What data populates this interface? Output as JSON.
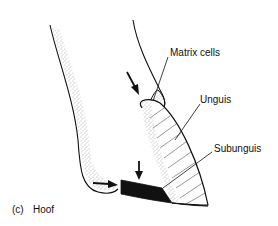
{
  "figure": {
    "panel_label": "(c)",
    "panel_title": "Hoof",
    "labels": {
      "matrix_cells": "Matrix cells",
      "unguis": "Unguis",
      "subunguis": "Subunguis"
    },
    "colors": {
      "ink": "#111111",
      "stipple": "#555555",
      "background": "#ffffff"
    }
  }
}
